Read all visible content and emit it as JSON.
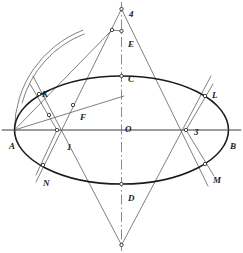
{
  "figure": {
    "kind": "geometric-construction",
    "title": "",
    "background": "#ffffff",
    "stroke_thin": "#55565a",
    "stroke_thick": "#1a1a1a",
    "axis_color": "#6a6b6f",
    "label_color": "#1c1c1c",
    "width": 243,
    "height": 253
  },
  "ellipse": {
    "center": {
      "x": 121.5,
      "y": 130
    },
    "semi_major": 107,
    "semi_minor": 54
  },
  "points": [
    {
      "id": "A",
      "label": "A",
      "x": 14.5,
      "y": 130,
      "lx": 9,
      "ly": 142,
      "marker": false
    },
    {
      "id": "B",
      "label": "B",
      "x": 228.5,
      "y": 130,
      "lx": 230,
      "ly": 142,
      "marker": false
    },
    {
      "id": "C",
      "label": "C",
      "x": 121.5,
      "y": 76,
      "lx": 128,
      "ly": 75,
      "marker": true
    },
    {
      "id": "D",
      "label": "D",
      "x": 121.5,
      "y": 184,
      "lx": 128,
      "ly": 194,
      "marker": true
    },
    {
      "id": "E",
      "label": "E",
      "x": 121.5,
      "y": 31,
      "lx": 128,
      "ly": 40,
      "marker": true
    },
    {
      "id": "O",
      "label": "O",
      "x": 121.5,
      "y": 130,
      "lx": 125,
      "ly": 125,
      "marker": false
    },
    {
      "id": "P1",
      "label": "1",
      "x": 57,
      "y": 130,
      "lx": 67,
      "ly": 143,
      "marker": true
    },
    {
      "id": "P2",
      "label": "2",
      "x": 121.5,
      "y": 245,
      "lx": 129,
      "ly": 253,
      "marker": true
    },
    {
      "id": "P3",
      "label": "3",
      "x": 186,
      "y": 130,
      "lx": 194,
      "ly": 128,
      "marker": true
    },
    {
      "id": "P4",
      "label": "4",
      "x": 121.5,
      "y": 9,
      "lx": 129,
      "ly": 10,
      "marker": true
    },
    {
      "id": "K",
      "label": "K",
      "x": 39,
      "y": 94,
      "lx": 42,
      "ly": 90,
      "marker": true
    },
    {
      "id": "L",
      "label": "L",
      "x": 205,
      "y": 96,
      "lx": 212,
      "ly": 91,
      "marker": true
    },
    {
      "id": "M",
      "label": "M",
      "x": 205,
      "y": 164,
      "lx": 213,
      "ly": 176,
      "marker": true
    },
    {
      "id": "N",
      "label": "N",
      "x": 43,
      "y": 165,
      "lx": 43,
      "ly": 179,
      "marker": true
    },
    {
      "id": "F",
      "label": "F",
      "x": 73,
      "y": 105,
      "lx": 80,
      "ly": 113,
      "marker": true
    },
    {
      "id": "G",
      "label": "",
      "x": 112,
      "y": 30,
      "lx": 0,
      "ly": 0,
      "marker": true
    },
    {
      "id": "H",
      "label": "",
      "x": 49,
      "y": 115,
      "lx": 0,
      "ly": 0,
      "marker": true
    }
  ],
  "segments": [
    {
      "name": "major-axis",
      "x1": 2,
      "y1": 130,
      "x2": 241,
      "y2": 130
    },
    {
      "name": "chord-A-to-G",
      "x1": 14.5,
      "y1": 130,
      "x2": 112,
      "y2": 30
    },
    {
      "name": "chord-A-to-F-ext",
      "x1": 14.5,
      "y1": 130,
      "x2": 124,
      "y2": 96
    },
    {
      "name": "line-4-to-1-ext",
      "x1": 121.5,
      "y1": 9,
      "x2": 36,
      "y2": 182
    },
    {
      "name": "line-4-to-3-ext",
      "x1": 121.5,
      "y1": 9,
      "x2": 208,
      "y2": 186
    },
    {
      "name": "line-2-to-1-ext",
      "x1": 121.5,
      "y1": 245,
      "x2": 33,
      "y2": 76
    },
    {
      "name": "line-2-to-3-ext",
      "x1": 121.5,
      "y1": 245,
      "x2": 211,
      "y2": 76
    },
    {
      "name": "ray-1-to-K-ext",
      "x1": 57,
      "y1": 130,
      "x2": 30,
      "y2": 84
    },
    {
      "name": "ray-1-to-N-ext",
      "x1": 57,
      "y1": 130,
      "x2": 36,
      "y2": 175
    },
    {
      "name": "ray-3-to-L-ext",
      "x1": 186,
      "y1": 130,
      "x2": 213,
      "y2": 84
    },
    {
      "name": "ray-3-to-M-ext",
      "x1": 186,
      "y1": 130,
      "x2": 214,
      "y2": 176
    },
    {
      "name": "tick-G-to-E",
      "x1": 112,
      "y1": 30,
      "x2": 121.5,
      "y2": 31
    }
  ],
  "arcs": [
    {
      "name": "arc-large-A-to-G",
      "cx": 121.5,
      "cy": 130,
      "r": 107,
      "start_deg": 180,
      "end_deg": 249
    },
    {
      "name": "arc-small-F-to-G",
      "cx": 121.5,
      "cy": 130,
      "r": 103,
      "start_deg": 195,
      "end_deg": 249
    }
  ],
  "axis_dashes": {
    "name": "vertical-center-axis",
    "x": 121.5,
    "y1": 2,
    "y2": 251
  }
}
